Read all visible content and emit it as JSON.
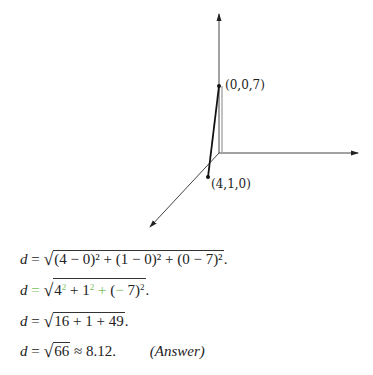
{
  "figure": {
    "axes": {
      "origin": [
        219,
        153
      ],
      "z_axis_end": [
        219,
        14
      ],
      "x_axis_end": [
        358,
        153
      ],
      "y_axis_end": [
        150,
        227
      ]
    },
    "points": [
      {
        "label": "(0,0,7)",
        "px": [
          219,
          86
        ]
      },
      {
        "label": "(4,1,0)",
        "px": [
          208,
          177
        ]
      }
    ]
  },
  "equations": [
    {
      "lhs": "d",
      "eq": "=",
      "radicand": "(4 − 0)² + (1 − 0)² + (0 − 7)²",
      "suffix": "."
    },
    {
      "lhs": "d",
      "eq": "=",
      "radicand_parts": [
        "4",
        "2",
        " + 1",
        "2",
        " + ",
        "(",
        "−",
        " 7)",
        "2"
      ],
      "suffix": "."
    },
    {
      "lhs": "d",
      "eq": "=",
      "radicand": "16 + 1 + 49",
      "suffix": "."
    },
    {
      "lhs": "d",
      "eq": "=",
      "radicand": "66",
      "approx": "≈ 8.12.",
      "note": "(Answer)"
    }
  ],
  "colors": {
    "highlight": "#7cbf5a",
    "ink": "#222222"
  }
}
